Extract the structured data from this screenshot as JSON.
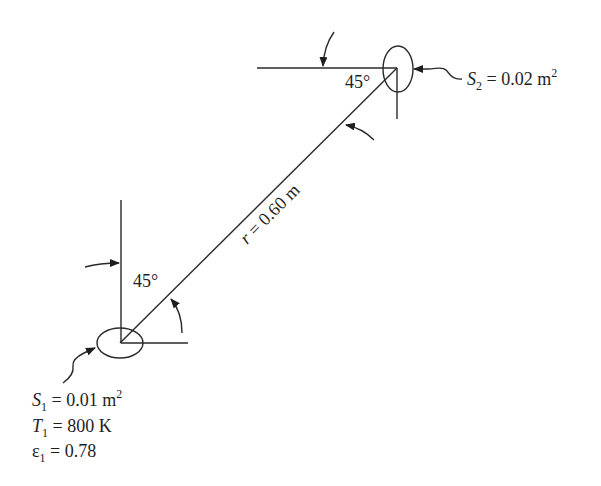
{
  "diagram": {
    "surface2": {
      "symbol": "S",
      "sub": "2",
      "value": " = 0.02 m",
      "sup": "2"
    },
    "surface1": {
      "area": {
        "symbol": "S",
        "sub": "1",
        "value": " = 0.01 m",
        "sup": "2"
      },
      "temperature": {
        "symbol": "T",
        "sub": "1",
        "value": " = 800 K"
      },
      "emissivity": {
        "symbol": "ε",
        "sub": "1",
        "value": " = 0.78"
      }
    },
    "distance": {
      "symbol": "r",
      "value": " = 0.60 m"
    },
    "angle_top": "45°",
    "angle_bottom": "45°"
  }
}
